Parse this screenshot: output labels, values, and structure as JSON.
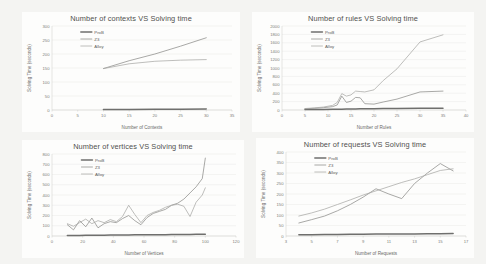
{
  "page": {
    "background": "#f4f4f2",
    "panel_background": "#fdfdfc"
  },
  "series_colors": {
    "prob": "#6f6f6d",
    "z3": "#8c8c8a",
    "alloy": "#a8a8a5"
  },
  "legend_labels": {
    "prob": "ProB",
    "z3": "Z3",
    "alloy": "Alloy"
  },
  "chart_data": [
    {
      "id": "contexts",
      "type": "line",
      "title": "Number of contexts VS Solving time",
      "xlabel": "Number of Contexts",
      "ylabel": "Solving Time (seconds)",
      "xlim": [
        0,
        35
      ],
      "ylim": [
        0,
        300
      ],
      "xticks": [
        0,
        5,
        10,
        15,
        20,
        25,
        30,
        35
      ],
      "yticks": [
        0,
        50,
        100,
        150,
        200,
        250,
        300
      ],
      "grid": true,
      "legend_position": "inside-top-left",
      "x": [
        10,
        15,
        20,
        25,
        30
      ],
      "series": [
        {
          "name": "ProB",
          "values": [
            2,
            2,
            3,
            3,
            4
          ]
        },
        {
          "name": "Z3",
          "values": [
            148,
            176,
            200,
            228,
            258
          ]
        },
        {
          "name": "Alloy",
          "values": [
            148,
            165,
            174,
            178,
            180
          ]
        }
      ]
    },
    {
      "id": "rules",
      "type": "line",
      "title": "Number of rules VS Solving time",
      "xlabel": "Number of Rules",
      "ylabel": "Solving Time (seconds)",
      "xlim": [
        0,
        40
      ],
      "ylim": [
        0,
        2000
      ],
      "xticks": [
        0,
        5,
        10,
        15,
        20,
        25,
        30,
        35,
        40
      ],
      "yticks": [
        0,
        200,
        400,
        600,
        800,
        1000,
        1200,
        1400,
        1600,
        1800,
        2000
      ],
      "grid": true,
      "legend_position": "inside-top-left",
      "x": [
        5,
        7,
        9,
        11,
        12,
        13,
        14,
        15,
        16,
        17,
        18,
        20,
        22,
        25,
        30,
        35
      ],
      "series": [
        {
          "name": "ProB",
          "values": [
            10,
            12,
            14,
            16,
            18,
            20,
            22,
            24,
            26,
            28,
            30,
            32,
            34,
            36,
            40,
            44
          ]
        },
        {
          "name": "Z3",
          "values": [
            30,
            40,
            55,
            80,
            120,
            330,
            180,
            210,
            300,
            290,
            150,
            140,
            190,
            260,
            430,
            450
          ]
        },
        {
          "name": "Alloy",
          "values": [
            35,
            50,
            70,
            110,
            180,
            390,
            330,
            360,
            450,
            440,
            430,
            480,
            700,
            980,
            1620,
            1790
          ]
        }
      ]
    },
    {
      "id": "vertices",
      "type": "line",
      "title": "Number of vertices VS Solving time",
      "xlabel": "Number of Vertices",
      "ylabel": "Solving Time (seconds)",
      "xlim": [
        0,
        120
      ],
      "ylim": [
        0,
        800
      ],
      "xticks": [
        0,
        20,
        40,
        60,
        80,
        100,
        120
      ],
      "yticks": [
        0,
        100,
        200,
        300,
        400,
        500,
        600,
        700,
        800
      ],
      "grid": true,
      "legend_position": "inside-top-left",
      "x": [
        10,
        14,
        18,
        22,
        26,
        30,
        34,
        38,
        42,
        46,
        50,
        54,
        58,
        62,
        66,
        70,
        74,
        78,
        82,
        86,
        90,
        94,
        98,
        100
      ],
      "series": [
        {
          "name": "ProB",
          "values": [
            5,
            6,
            6,
            7,
            7,
            8,
            8,
            9,
            9,
            10,
            10,
            11,
            11,
            12,
            12,
            13,
            13,
            14,
            14,
            15,
            15,
            16,
            16,
            17
          ]
        },
        {
          "name": "Z3",
          "values": [
            110,
            60,
            150,
            90,
            175,
            80,
            120,
            140,
            130,
            170,
            200,
            150,
            110,
            180,
            220,
            240,
            260,
            300,
            320,
            360,
            420,
            480,
            560,
            760
          ]
        },
        {
          "name": "Alloy",
          "values": [
            120,
            95,
            130,
            165,
            120,
            150,
            130,
            160,
            140,
            190,
            300,
            210,
            130,
            200,
            230,
            250,
            280,
            300,
            310,
            290,
            190,
            330,
            400,
            470
          ]
        }
      ]
    },
    {
      "id": "requests",
      "type": "line",
      "title": "Number of requests VS Solving time",
      "xlabel": "Number of Requests",
      "ylabel": "Solving Time (seconds)",
      "xlim": [
        3,
        17
      ],
      "ylim": [
        0,
        400
      ],
      "xticks": [
        3,
        5,
        7,
        9,
        11,
        13,
        15,
        17
      ],
      "yticks": [
        0,
        50,
        100,
        150,
        200,
        250,
        300,
        350,
        400
      ],
      "grid": true,
      "legend_position": "inside-top-left",
      "x": [
        4,
        5,
        6,
        7,
        8,
        9,
        10,
        11,
        12,
        13,
        14,
        15,
        16
      ],
      "series": [
        {
          "name": "ProB",
          "values": [
            6,
            6,
            7,
            7,
            8,
            8,
            9,
            9,
            10,
            10,
            11,
            11,
            12
          ]
        },
        {
          "name": "Z3",
          "values": [
            62,
            78,
            95,
            120,
            150,
            185,
            225,
            200,
            178,
            250,
            300,
            345,
            310
          ]
        },
        {
          "name": "Alloy",
          "values": [
            95,
            110,
            128,
            150,
            172,
            195,
            215,
            235,
            255,
            272,
            292,
            312,
            320
          ]
        }
      ]
    }
  ]
}
